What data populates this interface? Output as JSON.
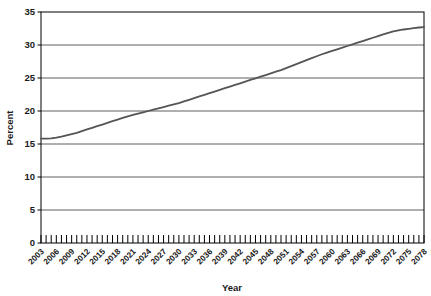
{
  "chart_data": {
    "type": "line",
    "title": "",
    "xlabel": "Year",
    "ylabel": "Percent",
    "xlim": [
      2003,
      2078
    ],
    "ylim": [
      0,
      35
    ],
    "grid": "horizontal",
    "legend": "none",
    "yticks": [
      0,
      5,
      10,
      15,
      20,
      25,
      30,
      35
    ],
    "ytick_labels": [
      "0",
      "5",
      "10",
      "15",
      "20",
      "25",
      "30",
      "35"
    ],
    "xtick_labels": [
      "2003",
      "2006",
      "2009",
      "2012",
      "2015",
      "2018",
      "2021",
      "2024",
      "2027",
      "2030",
      "2033",
      "2036",
      "2039",
      "2042",
      "2045",
      "2048",
      "2051",
      "2054",
      "2057",
      "2060",
      "2063",
      "2066",
      "2069",
      "2072",
      "2075",
      "2078"
    ],
    "xtick_label_rotation": -45,
    "minor_xticks_every": 1,
    "series": [
      {
        "name": "Percent",
        "color": "#555555",
        "line_width": 1.8,
        "x": [
          2003,
          2004,
          2005,
          2006,
          2007,
          2008,
          2009,
          2010,
          2011,
          2012,
          2013,
          2014,
          2015,
          2016,
          2017,
          2018,
          2019,
          2020,
          2021,
          2022,
          2023,
          2024,
          2025,
          2026,
          2027,
          2028,
          2029,
          2030,
          2031,
          2032,
          2033,
          2034,
          2035,
          2036,
          2037,
          2038,
          2039,
          2040,
          2041,
          2042,
          2043,
          2044,
          2045,
          2046,
          2047,
          2048,
          2049,
          2050,
          2051,
          2052,
          2053,
          2054,
          2055,
          2056,
          2057,
          2058,
          2059,
          2060,
          2061,
          2062,
          2063,
          2064,
          2065,
          2066,
          2067,
          2068,
          2069,
          2070,
          2071,
          2072,
          2073,
          2074,
          2075,
          2076,
          2077,
          2078
        ],
        "values": [
          15.8,
          15.8,
          15.85,
          15.95,
          16.1,
          16.3,
          16.5,
          16.7,
          16.95,
          17.2,
          17.45,
          17.7,
          17.95,
          18.2,
          18.45,
          18.7,
          18.95,
          19.2,
          19.4,
          19.6,
          19.8,
          20.0,
          20.2,
          20.4,
          20.6,
          20.8,
          21.0,
          21.2,
          21.45,
          21.7,
          21.95,
          22.2,
          22.45,
          22.7,
          22.95,
          23.2,
          23.45,
          23.7,
          23.95,
          24.2,
          24.45,
          24.7,
          24.95,
          25.2,
          25.45,
          25.7,
          25.95,
          26.2,
          26.5,
          26.8,
          27.1,
          27.4,
          27.7,
          28.0,
          28.3,
          28.6,
          28.85,
          29.1,
          29.35,
          29.6,
          29.85,
          30.1,
          30.35,
          30.6,
          30.85,
          31.1,
          31.35,
          31.6,
          31.85,
          32.05,
          32.2,
          32.35,
          32.45,
          32.55,
          32.65,
          32.7
        ]
      }
    ]
  },
  "axes": {
    "y_axis_title": "Percent",
    "x_axis_title": "Year"
  }
}
